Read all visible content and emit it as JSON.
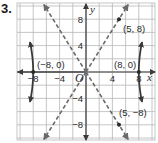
{
  "problem": {
    "number": "3."
  },
  "graph": {
    "x_axis_label": "x",
    "y_axis_label": "y",
    "origin_label": "O",
    "x_tick_labels": [
      {
        "value": -8,
        "text": "−8"
      },
      {
        "value": -4,
        "text": "−4"
      },
      {
        "value": 4,
        "text": "4"
      },
      {
        "value": 8,
        "text": "8"
      }
    ],
    "y_tick_labels": [
      {
        "value": 8,
        "text": "8"
      },
      {
        "value": 4,
        "text": "4"
      },
      {
        "value": -4,
        "text": "−4"
      },
      {
        "value": -8,
        "text": "−8"
      }
    ],
    "grid_step": 2,
    "range": {
      "x": [
        -10,
        10
      ],
      "y": [
        -10,
        10
      ]
    },
    "point_labels": {
      "left_vertex": "(−8, 0)",
      "right_vertex": "(8, 0)",
      "asymptote_point_upper": "(5, 8)",
      "asymptote_point_lower": "(5, −8)"
    },
    "points": [
      {
        "name": "left-vertex",
        "x": -8,
        "y": 0
      },
      {
        "name": "right-vertex",
        "x": 8,
        "y": 0
      },
      {
        "name": "asymptote-point-upper",
        "x": 5,
        "y": 8
      },
      {
        "name": "asymptote-point-lower",
        "x": 5,
        "y": -8
      }
    ],
    "asymptotes": [
      {
        "slope": 1.6,
        "style": "dashed"
      },
      {
        "slope": -1.6,
        "style": "dashed"
      }
    ],
    "curve": {
      "type": "hyperbola",
      "orientation": "horizontal",
      "a": 8,
      "b": 12.8
    },
    "colors": {
      "grid": "#b8b8b8",
      "axis": "#3a3a3a",
      "curve": "#3a3a3a",
      "asymptote": "#6a6a6a"
    }
  }
}
